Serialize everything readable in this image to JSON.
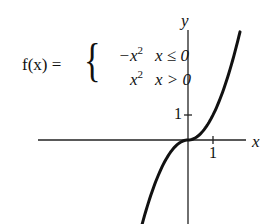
{
  "formula": {
    "lhs": "f(x) =",
    "cases": [
      {
        "expr": "−x",
        "exp": "2",
        "condition": "x ≤ 0"
      },
      {
        "expr": "x",
        "exp": "2",
        "condition": "x > 0"
      }
    ]
  },
  "axes": {
    "x_label": "x",
    "y_label": "y",
    "x_tick_label": "1",
    "y_tick_label": "1"
  },
  "colors": {
    "curve": "#111111",
    "axes": "#222222",
    "background": "#ffffff"
  },
  "chart_data": {
    "type": "line",
    "xlabel": "x",
    "ylabel": "y",
    "x_ticks": [
      1
    ],
    "y_ticks": [
      1
    ],
    "xlim": [
      -6,
      2.4
    ],
    "ylim": [
      -3.4,
      4.4
    ],
    "grid": false,
    "legend": "none",
    "series": [
      {
        "name": "f(x)",
        "piecewise": [
          {
            "expr": "-x^2",
            "domain": "x <= 0"
          },
          {
            "expr": "x^2",
            "domain": "x > 0"
          }
        ],
        "x": [
          -1.88,
          -1.5,
          -1.0,
          -0.5,
          0,
          0.5,
          1.0,
          1.5,
          2.08
        ],
        "y": [
          -3.53,
          -2.25,
          -1.0,
          -0.25,
          0,
          0.25,
          1.0,
          2.25,
          4.33
        ]
      }
    ]
  }
}
